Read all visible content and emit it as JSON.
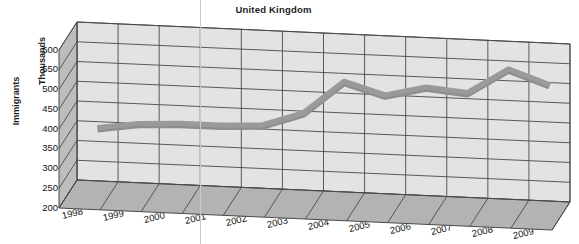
{
  "chart_data": {
    "type": "line",
    "title": "United Kingdom",
    "xlabel": "",
    "ylabel": "Immigrants",
    "ylabel_secondary": "Thousands",
    "categories": [
      "1998",
      "1999",
      "2000",
      "2001",
      "2002",
      "2003",
      "2004",
      "2005",
      "2006",
      "2007",
      "2008",
      "2009"
    ],
    "values": [
      335,
      350,
      355,
      355,
      360,
      395,
      480,
      450,
      475,
      465,
      530,
      495
    ],
    "series": [
      {
        "name": "Immigrants",
        "values": [
          335,
          350,
          355,
          355,
          360,
          395,
          480,
          450,
          475,
          465,
          530,
          495
        ]
      }
    ],
    "ylim": [
      200,
      600
    ],
    "ytick_values": [
      600,
      550,
      500,
      450,
      400,
      350,
      300,
      250,
      200
    ],
    "ytick_labels": [
      "600",
      "550",
      "500",
      "450",
      "400",
      "350",
      "300",
      "250",
      "200"
    ],
    "grid": true,
    "legend": false,
    "legend_position": "none",
    "style_3d": true
  },
  "colors": {
    "wall": "#e3e3e3",
    "wall_side": "#bdbdbd",
    "floor": "#b3b3b3",
    "gridline": "#4a4a4a",
    "series_line": "#9a9a9a",
    "text": "#1c1c1c",
    "background": "#ffffff"
  }
}
